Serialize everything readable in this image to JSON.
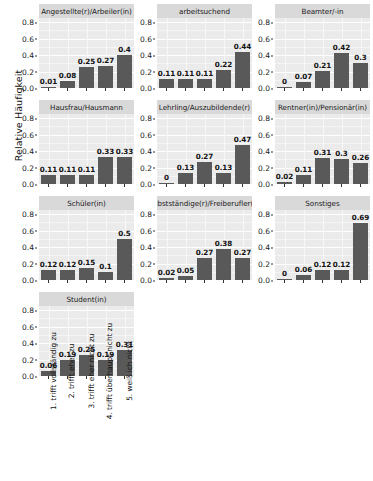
{
  "chart_data": {
    "type": "bar",
    "title": "",
    "xlabel": "",
    "ylabel": "Relative Häufigkeit",
    "ylim": [
      0,
      0.85
    ],
    "yticks": [
      0.0,
      0.2,
      0.4,
      0.6,
      0.8
    ],
    "ytick_labels": [
      "0.0",
      "0.2",
      "0.4",
      "0.6",
      "0.8"
    ],
    "grid": true,
    "legend": "none",
    "facet_layout": {
      "rows": 4,
      "cols": 3
    },
    "categories": [
      "1. trifft vollständig zu",
      "2. trifft eher zu",
      "3. trifft eher nicht zu",
      "4. trifft überhaupt nicht zu",
      "5. weiß ich nicht"
    ],
    "panels": [
      {
        "title": "Angestellte(r)/Arbeiler(in)",
        "values": [
          0.01,
          0.08,
          0.25,
          0.27,
          0.4
        ],
        "labels": [
          "0.01",
          "0.08",
          "0.25",
          "0.27",
          "0.4"
        ]
      },
      {
        "title": "arbeitsuchend",
        "values": [
          0.11,
          0.11,
          0.11,
          0.22,
          0.44
        ],
        "labels": [
          "0.11",
          "0.11",
          "0.11",
          "0.22",
          "0.44"
        ]
      },
      {
        "title": "Beamter/-in",
        "values": [
          0,
          0.07,
          0.21,
          0.42,
          0.3
        ],
        "labels": [
          "0",
          "0.07",
          "0.21",
          "0.42",
          "0.3"
        ]
      },
      {
        "title": "Hausfrau/Hausmann",
        "values": [
          0.11,
          0.11,
          0.11,
          0.33,
          0.33
        ],
        "labels": [
          "0.11",
          "0.11",
          "0.11",
          "0.33",
          "0.33"
        ]
      },
      {
        "title": "Lehrling/Auszubildende(r)",
        "values": [
          0,
          0.13,
          0.27,
          0.13,
          0.47
        ],
        "labels": [
          "0",
          "0.13",
          "0.27",
          "0.13",
          "0.47"
        ]
      },
      {
        "title": "Rentner(in)/Pensionär(in)",
        "values": [
          0.02,
          0.11,
          0.31,
          0.3,
          0.26
        ],
        "labels": [
          "0.02",
          "0.11",
          "0.31",
          "0.3",
          "0.26"
        ]
      },
      {
        "title": "Schüler(in)",
        "values": [
          0.12,
          0.12,
          0.15,
          0.1,
          0.5
        ],
        "labels": [
          "0.12",
          "0.12",
          "0.15",
          "0.1",
          "0.5"
        ]
      },
      {
        "title": "Selbstständige(r)/Freiberufler(in)",
        "values": [
          0.02,
          0.05,
          0.27,
          0.38,
          0.27
        ],
        "labels": [
          "0.02",
          "0.05",
          "0.27",
          "0.38",
          "0.27"
        ]
      },
      {
        "title": "Sonstiges",
        "values": [
          0,
          0.06,
          0.12,
          0.12,
          0.69
        ],
        "labels": [
          "0",
          "0.06",
          "0.12",
          "0.12",
          "0.69"
        ]
      },
      {
        "title": "Student(in)",
        "values": [
          0.06,
          0.19,
          0.25,
          0.19,
          0.31
        ],
        "labels": [
          "0.06",
          "0.19",
          "0.25",
          "0.19",
          "0.31"
        ]
      }
    ]
  },
  "colors": {
    "bar": "#595959",
    "panel_background": "#ebebeb",
    "strip_background": "#d9d9d9",
    "gridline": "#ffffff",
    "text": "#1a1a1a"
  }
}
